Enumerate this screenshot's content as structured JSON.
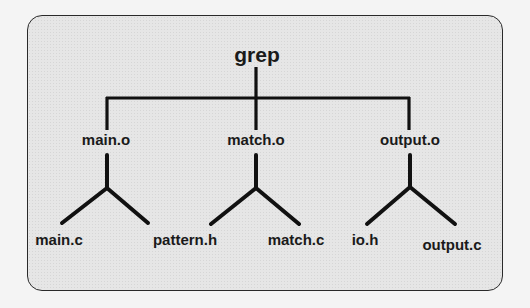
{
  "diagram": {
    "type": "dependency-tree",
    "colors": {
      "line": "#111111",
      "background": "#e6e6e6",
      "border": "#2a2a2a",
      "text": "#1a1a1a"
    },
    "root": {
      "label": "grep"
    },
    "children": [
      {
        "label": "main.o",
        "children": [
          {
            "label": "main.c"
          },
          {
            "label": "pattern.h"
          }
        ]
      },
      {
        "label": "match.o",
        "children": [
          {
            "label": "pattern.h"
          },
          {
            "label": "match.c"
          }
        ]
      },
      {
        "label": "output.o",
        "children": [
          {
            "label": "io.h"
          },
          {
            "label": "output.c"
          }
        ]
      }
    ],
    "leaf_labels": [
      "main.c",
      "pattern.h",
      "match.c",
      "io.h",
      "output.c"
    ]
  }
}
